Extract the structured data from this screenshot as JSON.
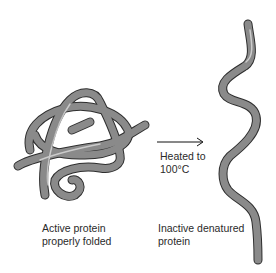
{
  "diagram": {
    "left_label_line1": "Active protein",
    "left_label_line2": "properly folded",
    "arrow_label_line1": "Heated to",
    "arrow_label_line2": "100°C",
    "right_label_line1": "Inactive denatured",
    "right_label_line2": "protein",
    "colors": {
      "protein_fill": "#8a8a8a",
      "protein_outline": "#2e2e2e",
      "highlight": "#e0e0e0",
      "arrow": "#111111"
    }
  }
}
